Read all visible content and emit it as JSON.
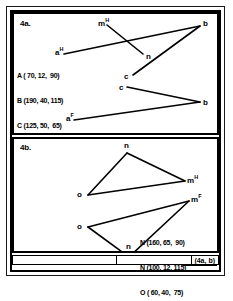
{
  "figure": {
    "caption": "(4a, b)"
  },
  "panels": [
    {
      "id": "4a",
      "label": "4a.",
      "vertices": [
        {
          "name": "m-h",
          "text": "m",
          "sup": "H"
        },
        {
          "name": "b-top",
          "text": "b",
          "sup": ""
        },
        {
          "name": "n",
          "text": "n",
          "sup": ""
        },
        {
          "name": "a-h",
          "text": "a",
          "sup": "H"
        },
        {
          "name": "c-upper",
          "text": "c",
          "sup": ""
        },
        {
          "name": "c-lower",
          "text": "c",
          "sup": ""
        },
        {
          "name": "b-bottom",
          "text": "b",
          "sup": ""
        },
        {
          "name": "a-f",
          "text": "a",
          "sup": "F"
        }
      ],
      "coordinates": [
        "A ( 70, 12,  90)",
        "B (190, 40, 115)",
        "C (125, 50,  65)",
        "M (100,  -, 115)",
        "N (135,  -,  90)"
      ]
    },
    {
      "id": "4b",
      "label": "4b.",
      "vertices": [
        {
          "name": "n-top",
          "text": "n",
          "sup": ""
        },
        {
          "name": "m-h",
          "text": "m",
          "sup": "H"
        },
        {
          "name": "o-upper",
          "text": "o",
          "sup": ""
        },
        {
          "name": "m-f",
          "text": "m",
          "sup": "F"
        },
        {
          "name": "o-lower",
          "text": "o",
          "sup": ""
        },
        {
          "name": "n-bottom",
          "text": "n",
          "sup": ""
        }
      ],
      "coordinates": [
        "N (160, 65,  90)",
        "N (100, 12, 115)",
        "O ( 60, 40,  75)"
      ]
    }
  ],
  "colors": {
    "ink": "#000000",
    "paper": "#ffffff"
  }
}
